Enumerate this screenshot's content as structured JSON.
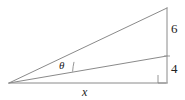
{
  "figure": {
    "background_color": "#ffffff",
    "stroke_color": "#8a8a8a",
    "text_color": "#222222",
    "labels": {
      "upper_segment": "6",
      "lower_segment": "4",
      "base": "x",
      "angle": "θ"
    },
    "icons": {
      "right_angle": "right-angle-marker",
      "angle_arc": "angle-arc-marker"
    },
    "geometry": {
      "apex": [
        9,
        83
      ],
      "top_vertex": [
        167,
        8
      ],
      "mid_vertex": [
        167,
        56
      ],
      "bottom_vertex": [
        167,
        83
      ],
      "vertical_line": {
        "x": 167,
        "y_top": 8,
        "y_bottom": 83
      },
      "base_line": {
        "x_left": 9,
        "x_right": 167,
        "y": 83
      },
      "upper_hypotenuse": [
        [
          9,
          83
        ],
        [
          167,
          8
        ]
      ],
      "lower_hypotenuse": [
        [
          9,
          83
        ],
        [
          167,
          56
        ]
      ],
      "right_angle_marker": {
        "x": 158,
        "y": 74,
        "size": 8
      },
      "angle_arc": {
        "center": [
          9,
          83
        ],
        "radius": 66,
        "start_angle_deg": -25.4,
        "end_angle_deg": -9.7
      }
    }
  }
}
